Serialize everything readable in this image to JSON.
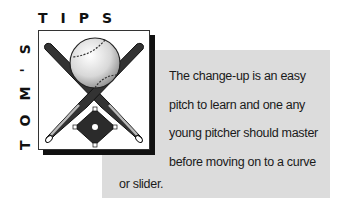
{
  "header": {
    "tips_label": "TIPS",
    "toms_label": "TOM'S"
  },
  "illustration": {
    "description": "Crossed baseball bats with a baseball above and a baseball diamond below",
    "icons": [
      "baseball-icon",
      "baseball-bat-icon",
      "baseball-diamond-icon"
    ]
  },
  "tip": {
    "lines": [
      "The change-up is an easy",
      "pitch to learn and one any",
      "young pitcher should master",
      "before moving on to a curve",
      "or slider."
    ]
  },
  "colors": {
    "background": "#ffffff",
    "box": "#dcdcdc",
    "text": "#1a1a1a",
    "shadow": "#111111"
  }
}
